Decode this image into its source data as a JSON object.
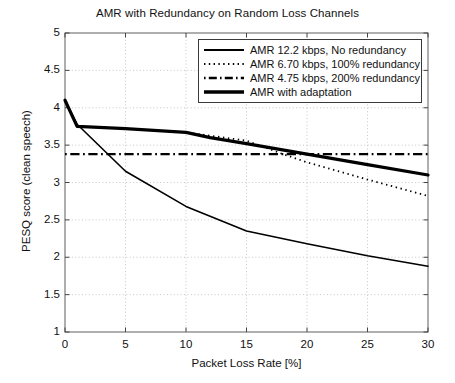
{
  "chart_data": {
    "type": "line",
    "title": "AMR with Redundancy on Random Loss Channels",
    "xlabel": "Packet Loss Rate [%]",
    "ylabel": "PESQ score (clean speech)",
    "xlim": [
      0,
      30
    ],
    "ylim": [
      1,
      5
    ],
    "xticks": [
      0,
      5,
      10,
      15,
      20,
      25,
      30
    ],
    "yticks": [
      1,
      1.5,
      2,
      2.5,
      3,
      3.5,
      4,
      4.5,
      5
    ],
    "xtick_labels": [
      "0",
      "5",
      "10",
      "15",
      "20",
      "25",
      "30"
    ],
    "ytick_labels": [
      "1",
      "1.5",
      "2",
      "2.5",
      "3",
      "3.5",
      "4",
      "4.5",
      "5"
    ],
    "grid": true,
    "grid_style": "dotted",
    "legend_position": "top-right",
    "series": [
      {
        "name": "AMR 12.2 kbps, No redundancy",
        "style": "solid",
        "width": 1.6,
        "color": "#000000",
        "x": [
          0,
          1,
          5,
          10,
          15,
          20,
          25,
          30
        ],
        "y": [
          4.1,
          3.78,
          3.15,
          2.68,
          2.35,
          2.18,
          2.02,
          1.88
        ]
      },
      {
        "name": "AMR 6.70 kbps, 100% redundancy",
        "style": "dotted",
        "width": 1.8,
        "color": "#000000",
        "x": [
          0,
          1,
          5,
          10,
          15,
          16,
          18,
          20,
          25,
          30
        ],
        "y": [
          4.1,
          3.75,
          3.72,
          3.67,
          3.56,
          3.5,
          3.38,
          3.27,
          3.04,
          2.82
        ]
      },
      {
        "name": "AMR 4.75 kbps, 200% redundancy",
        "style": "dashdot",
        "width": 2.2,
        "color": "#000000",
        "x": [
          0,
          5,
          10,
          15,
          20,
          25,
          30
        ],
        "y": [
          3.38,
          3.38,
          3.38,
          3.38,
          3.38,
          3.38,
          3.38
        ]
      },
      {
        "name": "AMR with adaptation",
        "style": "solid",
        "width": 3.2,
        "color": "#000000",
        "x": [
          0,
          1,
          5,
          10,
          12,
          15,
          20,
          25,
          30
        ],
        "y": [
          4.1,
          3.75,
          3.72,
          3.67,
          3.6,
          3.52,
          3.38,
          3.24,
          3.1
        ]
      }
    ]
  },
  "legend": {
    "items": [
      {
        "label": "AMR 12.2 kbps, No redundancy",
        "style": "solid-thin"
      },
      {
        "label": "AMR 6.70 kbps, 100% redundancy",
        "style": "dotted"
      },
      {
        "label": "AMR 4.75 kbps, 200% redundancy",
        "style": "dashdot"
      },
      {
        "label": "AMR with adaptation",
        "style": "solid-thick"
      }
    ]
  }
}
